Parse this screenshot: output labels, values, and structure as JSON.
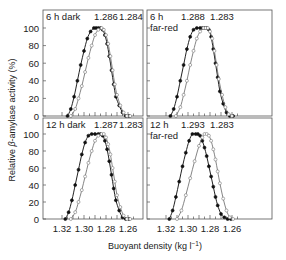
{
  "chart_data": {
    "type": "line",
    "title": "",
    "ylabel": "Relative β-amylase activity (%)",
    "xlabel": "Buoyant density (kg l⁻¹)",
    "x_ticks": [
      "1.32",
      "1.30",
      "1.28",
      "1.26"
    ],
    "y_ticks": [
      "0",
      "20",
      "40",
      "60",
      "80",
      "100"
    ],
    "xlim": [
      1.32,
      1.255
    ],
    "ylim": [
      0,
      100
    ],
    "grid": false,
    "panels": [
      {
        "id": "top-left",
        "label_line1": "6 h dark",
        "label_line2": "",
        "peak_labels": [
          "1.286",
          "1.284"
        ],
        "series": [
          {
            "name": "filled",
            "marker": "filled",
            "x": [
              1.315,
              1.312,
              1.309,
              1.306,
              1.303,
              1.3,
              1.297,
              1.294,
              1.291,
              1.289,
              1.287,
              1.285,
              1.283,
              1.281,
              1.279,
              1.277,
              1.275,
              1.273,
              1.271,
              1.268,
              1.265,
              1.262,
              1.259
            ],
            "y": [
              0,
              8,
              22,
              40,
              58,
              74,
              88,
              96,
              100,
              100,
              100,
              100,
              98,
              92,
              82,
              68,
              52,
              36,
              22,
              12,
              4,
              0,
              0
            ]
          },
          {
            "name": "open",
            "marker": "open",
            "x": [
              1.312,
              1.308,
              1.305,
              1.302,
              1.299,
              1.296,
              1.293,
              1.29,
              1.287,
              1.284,
              1.282,
              1.28,
              1.278,
              1.276,
              1.274,
              1.272,
              1.27,
              1.267,
              1.264,
              1.261,
              1.258
            ],
            "y": [
              0,
              8,
              20,
              34,
              50,
              66,
              80,
              92,
              98,
              100,
              98,
              92,
              82,
              68,
              52,
              36,
              24,
              12,
              4,
              0,
              0
            ]
          }
        ]
      },
      {
        "id": "top-right",
        "label_line1": "6 h",
        "label_line2": "far-red",
        "peak_labels": [
          "1.288",
          "1.283"
        ],
        "series": [
          {
            "name": "filled",
            "marker": "filled",
            "x": [
              1.316,
              1.313,
              1.31,
              1.307,
              1.304,
              1.301,
              1.298,
              1.295,
              1.292,
              1.289,
              1.287,
              1.285,
              1.283,
              1.281,
              1.279,
              1.277,
              1.275,
              1.273,
              1.271,
              1.268,
              1.265,
              1.262,
              1.259
            ],
            "y": [
              0,
              8,
              22,
              40,
              58,
              76,
              90,
              98,
              100,
              100,
              100,
              100,
              100,
              98,
              90,
              76,
              60,
              44,
              28,
              14,
              4,
              0,
              0
            ]
          },
          {
            "name": "open",
            "marker": "open",
            "x": [
              1.311,
              1.307,
              1.304,
              1.301,
              1.298,
              1.295,
              1.292,
              1.289,
              1.286,
              1.284,
              1.282,
              1.28,
              1.278,
              1.276,
              1.274,
              1.272,
              1.269,
              1.266,
              1.263,
              1.26
            ],
            "y": [
              0,
              10,
              24,
              40,
              58,
              74,
              88,
              96,
              100,
              100,
              100,
              96,
              88,
              74,
              58,
              42,
              24,
              10,
              2,
              0
            ]
          }
        ]
      },
      {
        "id": "bottom-left",
        "label_line1": "12 h dark",
        "label_line2": "",
        "peak_labels": [
          "1.287",
          "1.283"
        ],
        "series": [
          {
            "name": "filled",
            "marker": "filled",
            "x": [
              1.317,
              1.314,
              1.311,
              1.308,
              1.305,
              1.302,
              1.299,
              1.296,
              1.293,
              1.29,
              1.287,
              1.285,
              1.283,
              1.281,
              1.279,
              1.277,
              1.275,
              1.273,
              1.271,
              1.268,
              1.265,
              1.262,
              1.259
            ],
            "y": [
              0,
              8,
              22,
              40,
              58,
              76,
              90,
              98,
              100,
              100,
              100,
              100,
              98,
              92,
              82,
              68,
              52,
              36,
              22,
              10,
              2,
              0,
              0
            ]
          },
          {
            "name": "open",
            "marker": "open",
            "x": [
              1.312,
              1.308,
              1.305,
              1.302,
              1.299,
              1.296,
              1.293,
              1.29,
              1.287,
              1.284,
              1.282,
              1.28,
              1.278,
              1.276,
              1.274,
              1.272,
              1.27,
              1.267,
              1.264,
              1.261,
              1.258
            ],
            "y": [
              0,
              8,
              20,
              34,
              50,
              66,
              80,
              92,
              98,
              100,
              100,
              96,
              88,
              76,
              60,
              44,
              28,
              14,
              4,
              0,
              0
            ]
          }
        ]
      },
      {
        "id": "bottom-right",
        "label_line1": "12 h",
        "label_line2": "far-red",
        "peak_labels": [
          "1.293",
          "1.283"
        ],
        "series": [
          {
            "name": "filled",
            "marker": "filled",
            "x": [
              1.317,
              1.314,
              1.311,
              1.308,
              1.305,
              1.302,
              1.299,
              1.296,
              1.293,
              1.291,
              1.289,
              1.287,
              1.285,
              1.283,
              1.281,
              1.279,
              1.277,
              1.275,
              1.273,
              1.27,
              1.267,
              1.264,
              1.261
            ],
            "y": [
              0,
              10,
              26,
              44,
              62,
              78,
              92,
              100,
              100,
              100,
              98,
              92,
              84,
              74,
              62,
              50,
              38,
              26,
              16,
              6,
              2,
              0,
              0
            ]
          },
          {
            "name": "open",
            "marker": "open",
            "x": [
              1.31,
              1.306,
              1.302,
              1.298,
              1.294,
              1.29,
              1.287,
              1.285,
              1.283,
              1.281,
              1.279,
              1.277,
              1.275,
              1.273,
              1.271,
              1.268,
              1.265,
              1.262,
              1.259
            ],
            "y": [
              0,
              10,
              28,
              48,
              68,
              86,
              96,
              100,
              100,
              98,
              92,
              82,
              70,
              56,
              42,
              24,
              10,
              2,
              0
            ]
          }
        ]
      }
    ]
  },
  "axes": {
    "ylabel_prefix": "Relative ",
    "ylabel_beta": "β",
    "ylabel_suffix": "-amylase activity (%)",
    "xlabel": "Buoyant density (kg l",
    "xlabel_sup": "−1",
    "xlabel_close": ")"
  }
}
